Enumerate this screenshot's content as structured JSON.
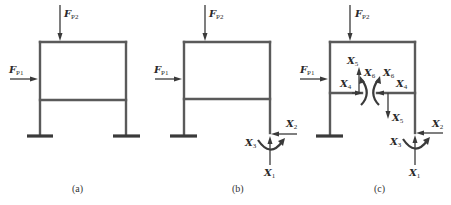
{
  "figure": {
    "panels": [
      {
        "caption": "(a)",
        "loads": {
          "fp2": {
            "symbol": "F",
            "sub": "P2"
          },
          "fp1": {
            "symbol": "F",
            "sub": "P1"
          }
        }
      },
      {
        "caption": "(b)",
        "loads": {
          "fp2": {
            "symbol": "F",
            "sub": "P2"
          },
          "fp1": {
            "symbol": "F",
            "sub": "P1"
          }
        },
        "redundants": {
          "x1": {
            "symbol": "X",
            "sub": "1"
          },
          "x2": {
            "symbol": "X",
            "sub": "2"
          },
          "x3": {
            "symbol": "X",
            "sub": "3"
          }
        }
      },
      {
        "caption": "(c)",
        "loads": {
          "fp2": {
            "symbol": "F",
            "sub": "P2"
          },
          "fp1": {
            "symbol": "F",
            "sub": "P1"
          }
        },
        "redundants": {
          "x1": {
            "symbol": "X",
            "sub": "1"
          },
          "x2": {
            "symbol": "X",
            "sub": "2"
          },
          "x3": {
            "symbol": "X",
            "sub": "3"
          },
          "x4_left": {
            "symbol": "X",
            "sub": "4"
          },
          "x4_right": {
            "symbol": "X",
            "sub": "4"
          },
          "x5_up": {
            "symbol": "X",
            "sub": "5"
          },
          "x5_down": {
            "symbol": "X",
            "sub": "5"
          },
          "x6_left": {
            "symbol": "X",
            "sub": "6"
          },
          "x6_right": {
            "symbol": "X",
            "sub": "6"
          }
        }
      }
    ],
    "colors": {
      "member": "#5a5a5a",
      "ink": "#3a3a3a",
      "background": "#ffffff"
    }
  }
}
